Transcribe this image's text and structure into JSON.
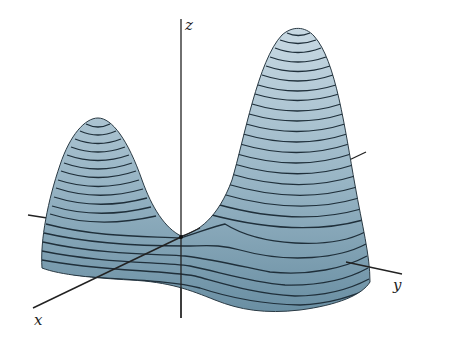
{
  "figure": {
    "type": "3d-surface-plot",
    "axes": {
      "x_label": "x",
      "y_label": "y",
      "z_label": "z"
    },
    "colors": {
      "surface_top": "#c3d5e0",
      "surface_bottom": "#6f93a6",
      "contour_line": "#1f2f3a",
      "axis_line": "#222222",
      "background": "#ffffff"
    },
    "features": [
      {
        "name": "left-peak",
        "relative_height": "lower"
      },
      {
        "name": "right-peak",
        "relative_height": "higher"
      },
      {
        "name": "saddle",
        "location": "near origin between peaks"
      }
    ]
  }
}
